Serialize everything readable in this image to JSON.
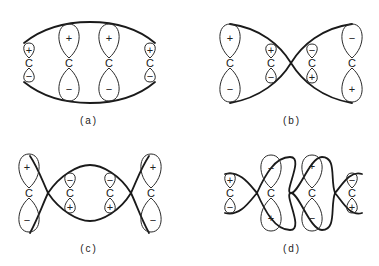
{
  "figure": {
    "panels": [
      {
        "id": "a",
        "caption": "(a)",
        "atoms": [
          {
            "label": "C",
            "top_sign": "+",
            "bottom_sign": "−",
            "size": "small"
          },
          {
            "label": "C",
            "top_sign": "+",
            "bottom_sign": "−",
            "size": "large"
          },
          {
            "label": "C",
            "top_sign": "+",
            "bottom_sign": "−",
            "size": "large"
          },
          {
            "label": "C",
            "top_sign": "+",
            "bottom_sign": "−",
            "size": "small"
          }
        ]
      },
      {
        "id": "b",
        "caption": "(b)",
        "atoms": [
          {
            "label": "C",
            "top_sign": "+",
            "bottom_sign": "−",
            "size": "large"
          },
          {
            "label": "C",
            "top_sign": "+",
            "bottom_sign": "−",
            "size": "small"
          },
          {
            "label": "C",
            "top_sign": "−",
            "bottom_sign": "+",
            "size": "small"
          },
          {
            "label": "C",
            "top_sign": "−",
            "bottom_sign": "+",
            "size": "large"
          }
        ]
      },
      {
        "id": "c",
        "caption": "(c)",
        "atoms": [
          {
            "label": "C",
            "top_sign": "+",
            "bottom_sign": "−",
            "size": "large"
          },
          {
            "label": "C",
            "top_sign": "−",
            "bottom_sign": "+",
            "size": "small"
          },
          {
            "label": "C",
            "top_sign": "−",
            "bottom_sign": "+",
            "size": "small"
          },
          {
            "label": "C",
            "top_sign": "+",
            "bottom_sign": "−",
            "size": "large"
          }
        ]
      },
      {
        "id": "d",
        "caption": "(d)",
        "atoms": [
          {
            "label": "C",
            "top_sign": "+",
            "bottom_sign": "−",
            "size": "small"
          },
          {
            "label": "C",
            "top_sign": "−",
            "bottom_sign": "+",
            "size": "large"
          },
          {
            "label": "C",
            "top_sign": "+",
            "bottom_sign": "−",
            "size": "large"
          },
          {
            "label": "C",
            "top_sign": "−",
            "bottom_sign": "+",
            "size": "small"
          }
        ]
      }
    ]
  }
}
